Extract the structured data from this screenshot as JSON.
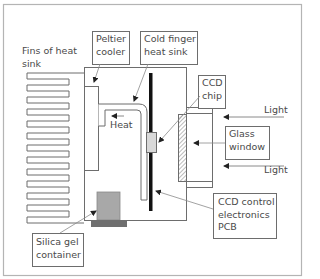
{
  "figure": {
    "colors": {
      "frame": "#b4b4b4",
      "line": "#6d6d6d",
      "pcb": "#111111",
      "chip": "#d8d8d8",
      "silica_gel": "#a8a8a8",
      "silica_base": "#6f6f6f",
      "leader": "#8a8a8a"
    }
  },
  "labels": {
    "fins": "Fins of heat\nsink",
    "peltier": "Peltier\ncooler",
    "cold_finger": "Cold finger\nheat sink",
    "ccd_chip": "CCD\nchip",
    "heat": "Heat",
    "light_top": "Light",
    "glass_window": "Glass\nwindow",
    "light_bottom": "Light",
    "pcb": "CCD control\nelectronics\nPCB",
    "silica_gel": "Silica gel\ncontainer"
  },
  "components": {
    "heat_sink_fin_count": 12
  }
}
